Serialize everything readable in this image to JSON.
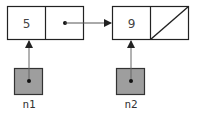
{
  "nodes": [
    {
      "id": "node1",
      "value": "5",
      "next": "node2"
    },
    {
      "id": "node2",
      "value": "9",
      "next": null
    }
  ],
  "pointers": [
    {
      "name": "n1",
      "target": "node1"
    },
    {
      "name": "n2",
      "target": "node2"
    }
  ],
  "colors": {
    "pointer_box_fill": "#9e9e9e",
    "stroke": "#222222",
    "arrow": "#555555"
  }
}
